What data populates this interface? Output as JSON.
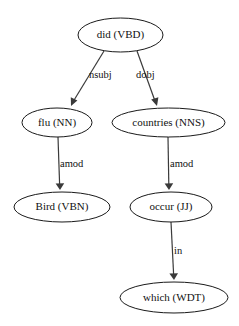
{
  "diagram": {
    "type": "dependency-parse-tree",
    "background_color": "#ffffff",
    "node_fill_color": "#ffffff",
    "node_stroke_color": "#1a1a1a",
    "edge_color": "#3a3a3a",
    "text_color": "#111111",
    "nodes": [
      {
        "id": "did",
        "label": "did (VBD)",
        "word": "did",
        "pos_tag": "VBD",
        "cx": 120.5,
        "cy": 35,
        "rx": 42.5,
        "ry": 17
      },
      {
        "id": "flu",
        "label": "flu (NN)",
        "word": "flu",
        "pos_tag": "NN",
        "cx": 57,
        "cy": 122.5,
        "rx": 35,
        "ry": 14.5
      },
      {
        "id": "countries",
        "label": "countries (NNS)",
        "word": "countries",
        "pos_tag": "NNS",
        "cx": 168.5,
        "cy": 122.5,
        "rx": 56.5,
        "ry": 14.5
      },
      {
        "id": "bird",
        "label": "Bird (VBN)",
        "word": "Bird",
        "pos_tag": "VBN",
        "cx": 62,
        "cy": 207,
        "rx": 48,
        "ry": 15
      },
      {
        "id": "occur",
        "label": "occur (JJ)",
        "word": "occur",
        "pos_tag": "JJ",
        "cx": 171,
        "cy": 207,
        "rx": 41,
        "ry": 15
      },
      {
        "id": "which",
        "label": "which (WDT)",
        "word": "which",
        "pos_tag": "WDT",
        "cx": 174,
        "cy": 297.5,
        "rx": 54,
        "ry": 15.5
      }
    ],
    "edges": [
      {
        "id": "did-flu",
        "from": "did",
        "to": "flu",
        "label": "nsubj",
        "x1": 104,
        "y1": 51,
        "x2": 71,
        "y2": 106,
        "label_x": 89,
        "label_y": 76
      },
      {
        "id": "did-countries",
        "from": "did",
        "to": "countries",
        "label": "dobj",
        "x1": 137,
        "y1": 51,
        "x2": 157,
        "y2": 106,
        "label_x": 136,
        "label_y": 76
      },
      {
        "id": "flu-bird",
        "from": "flu",
        "to": "bird",
        "label": "amod",
        "x1": 58,
        "y1": 137,
        "x2": 60,
        "y2": 190,
        "label_x": 60,
        "label_y": 165
      },
      {
        "id": "countries-occur",
        "from": "countries",
        "to": "occur",
        "label": "amod",
        "x1": 168,
        "y1": 137,
        "x2": 169,
        "y2": 190,
        "label_x": 170,
        "label_y": 165
      },
      {
        "id": "occur-which",
        "from": "occur",
        "to": "which",
        "label": "in",
        "x1": 171,
        "y1": 222,
        "x2": 174,
        "y2": 280,
        "label_x": 174,
        "label_y": 252
      }
    ]
  }
}
